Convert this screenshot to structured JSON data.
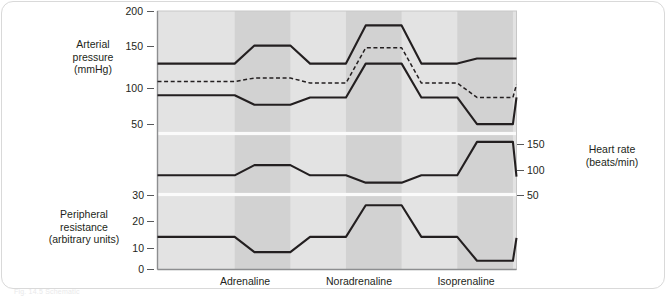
{
  "figure": {
    "caption_partial": "Fig. 14.5  Schematic"
  },
  "panels": {
    "arterial": {
      "axis_title_lines": [
        "Arterial",
        "pressure",
        "(mmHg)"
      ],
      "ticks": [
        50,
        100,
        150,
        200
      ],
      "series_labels": {
        "systolic": "Systolic",
        "mean": "Mean",
        "diastolic": "Diastolic"
      }
    },
    "heart_rate": {
      "axis_title_lines": [
        "Heart rate",
        "(beats/min)"
      ],
      "ticks": [
        50,
        100,
        150
      ]
    },
    "resistance": {
      "axis_title_lines": [
        "Peripheral",
        "resistance",
        "(arbitrary units)"
      ],
      "ticks": [
        0,
        10,
        20,
        30
      ]
    }
  },
  "categories": [
    "Adrenaline",
    "Noradrenaline",
    "Isoprenaline"
  ],
  "colors": {
    "plot_background": "#e3e3e3",
    "band_shaded": "#d2d2d2",
    "curve": "#231f20",
    "gridline": "#fbfbfb",
    "tick": "#58595b",
    "text": "#231f20"
  },
  "chart_data": {
    "type": "line",
    "title": "",
    "xlabel": "",
    "grid": "horizontal white separators between panels",
    "legend": "inline labels (Systolic, Mean, Diastolic)",
    "x_axis": {
      "type": "categorical time course",
      "categories": [
        "Adrenaline",
        "Noradrenaline",
        "Isoprenaline"
      ],
      "infusion_bands": [
        {
          "drug": "Adrenaline",
          "start": 0.215,
          "end": 0.37
        },
        {
          "drug": "Noradrenaline",
          "start": 0.525,
          "end": 0.68
        },
        {
          "drug": "Isoprenaline",
          "start": 0.835,
          "end": 0.99
        }
      ]
    },
    "panels": [
      {
        "name": "Arterial pressure (mmHg)",
        "ylabel": "Arterial pressure (mmHg)",
        "ylim": [
          30,
          200
        ],
        "yticks": [
          50,
          100,
          150,
          200
        ],
        "series": [
          {
            "name": "Systolic",
            "style": "solid",
            "x": [
              0.0,
              0.215,
              0.27,
              0.325,
              0.37,
              0.425,
              0.525,
              0.58,
              0.635,
              0.68,
              0.735,
              0.835,
              0.89,
              0.94,
              0.99,
              1.0
            ],
            "values": [
              127,
              127,
              152,
              152,
              152,
              127,
              127,
              180,
              180,
              180,
              127,
              127,
              134,
              134,
              134,
              134
            ]
          },
          {
            "name": "Mean",
            "style": "dashed",
            "x": [
              0.0,
              0.215,
              0.27,
              0.325,
              0.37,
              0.425,
              0.525,
              0.58,
              0.635,
              0.68,
              0.735,
              0.835,
              0.89,
              0.94,
              0.99,
              1.0
            ],
            "values": [
              102,
              102,
              107,
              107,
              107,
              100,
              100,
              149,
              149,
              149,
              100,
              100,
              80,
              80,
              80,
              98
            ]
          },
          {
            "name": "Diastolic",
            "style": "solid",
            "x": [
              0.0,
              0.215,
              0.27,
              0.325,
              0.37,
              0.425,
              0.525,
              0.58,
              0.635,
              0.68,
              0.735,
              0.835,
              0.89,
              0.94,
              0.99,
              1.0
            ],
            "values": [
              83,
              83,
              70,
              70,
              70,
              80,
              80,
              127,
              127,
              127,
              80,
              80,
              43,
              43,
              43,
              80
            ]
          }
        ]
      },
      {
        "name": "Heart rate (beats/min)",
        "ylabel": "Heart rate (beats/min)",
        "ylim": [
          28,
          175
        ],
        "yticks": [
          50,
          100,
          150
        ],
        "series": [
          {
            "name": "Heart rate",
            "style": "solid",
            "x": [
              0.0,
              0.215,
              0.27,
              0.325,
              0.37,
              0.425,
              0.525,
              0.58,
              0.635,
              0.68,
              0.735,
              0.835,
              0.89,
              0.94,
              0.99,
              1.0
            ],
            "values": [
              75,
              75,
              100,
              100,
              100,
              75,
              75,
              57,
              57,
              57,
              75,
              75,
              157,
              157,
              157,
              72
            ]
          }
        ]
      },
      {
        "name": "Peripheral resistance (arbitrary units)",
        "ylabel": "Peripheral resistance (arbitrary units)",
        "ylim": [
          0,
          34
        ],
        "yticks": [
          0,
          10,
          20,
          30
        ],
        "series": [
          {
            "name": "Peripheral resistance",
            "style": "solid",
            "x": [
              0.0,
              0.215,
              0.27,
              0.325,
              0.37,
              0.425,
              0.525,
              0.58,
              0.635,
              0.68,
              0.735,
              0.835,
              0.89,
              0.94,
              0.99,
              1.0
            ],
            "values": [
              15,
              15,
              8,
              8,
              8,
              15,
              15,
              29.5,
              29.5,
              29.5,
              15,
              15,
              4,
              4,
              4,
              14.5
            ]
          }
        ]
      }
    ]
  }
}
